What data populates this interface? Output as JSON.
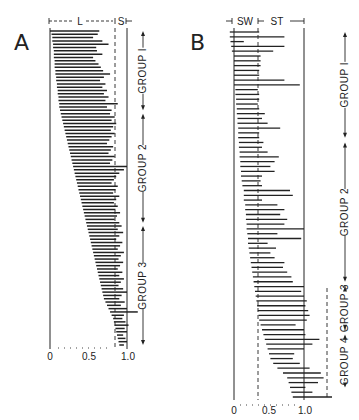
{
  "chart_data": [
    {
      "type": "bar",
      "orientation": "horizontal",
      "panel": "A",
      "title": "A",
      "header_labels": [
        "L",
        "S"
      ],
      "xlabel": "",
      "ylabel": "",
      "xlim": [
        0,
        1.0
      ],
      "x_ticks": [
        "0",
        "0.5",
        "1.0"
      ],
      "boundary_dashed_at": 0.85,
      "groups": [
        {
          "label": "GROUP 1",
          "row_range": [
            0,
            24
          ]
        },
        {
          "label": "GROUP 2",
          "row_range": [
            25,
            58
          ]
        },
        {
          "label": "GROUP 3",
          "row_range": [
            59,
            95
          ]
        }
      ],
      "bars": [
        {
          "start": 0.0,
          "end": 0.64
        },
        {
          "start": 0.02,
          "end": 0.62
        },
        {
          "start": 0.03,
          "end": 0.56
        },
        {
          "start": 0.03,
          "end": 0.68
        },
        {
          "start": 0.04,
          "end": 0.76
        },
        {
          "start": 0.04,
          "end": 0.6
        },
        {
          "start": 0.05,
          "end": 0.61
        },
        {
          "start": 0.05,
          "end": 0.68
        },
        {
          "start": 0.05,
          "end": 0.56
        },
        {
          "start": 0.06,
          "end": 0.59
        },
        {
          "start": 0.06,
          "end": 0.63
        },
        {
          "start": 0.06,
          "end": 0.66
        },
        {
          "start": 0.07,
          "end": 0.69
        },
        {
          "start": 0.07,
          "end": 0.78
        },
        {
          "start": 0.08,
          "end": 0.7
        },
        {
          "start": 0.08,
          "end": 0.65
        },
        {
          "start": 0.09,
          "end": 0.72
        },
        {
          "start": 0.09,
          "end": 0.68
        },
        {
          "start": 0.1,
          "end": 0.74
        },
        {
          "start": 0.1,
          "end": 0.7
        },
        {
          "start": 0.11,
          "end": 0.76
        },
        {
          "start": 0.11,
          "end": 0.72
        },
        {
          "start": 0.12,
          "end": 0.88
        },
        {
          "start": 0.12,
          "end": 0.74
        },
        {
          "start": 0.13,
          "end": 0.8
        },
        {
          "start": 0.14,
          "end": 0.78
        },
        {
          "start": 0.15,
          "end": 0.84
        },
        {
          "start": 0.16,
          "end": 0.8
        },
        {
          "start": 0.17,
          "end": 0.86
        },
        {
          "start": 0.18,
          "end": 0.82
        },
        {
          "start": 0.19,
          "end": 0.79
        },
        {
          "start": 0.2,
          "end": 0.84
        },
        {
          "start": 0.21,
          "end": 0.8
        },
        {
          "start": 0.22,
          "end": 0.77
        },
        {
          "start": 0.23,
          "end": 0.74
        },
        {
          "start": 0.24,
          "end": 0.82
        },
        {
          "start": 0.25,
          "end": 0.79
        },
        {
          "start": 0.26,
          "end": 0.76
        },
        {
          "start": 0.27,
          "end": 0.84
        },
        {
          "start": 0.28,
          "end": 0.81
        },
        {
          "start": 0.29,
          "end": 0.78
        },
        {
          "start": 0.3,
          "end": 1.0
        },
        {
          "start": 0.31,
          "end": 0.96
        },
        {
          "start": 0.32,
          "end": 0.9
        },
        {
          "start": 0.33,
          "end": 0.86
        },
        {
          "start": 0.34,
          "end": 0.83
        },
        {
          "start": 0.35,
          "end": 0.8
        },
        {
          "start": 0.36,
          "end": 0.88
        },
        {
          "start": 0.37,
          "end": 0.85
        },
        {
          "start": 0.38,
          "end": 0.82
        },
        {
          "start": 0.39,
          "end": 0.9
        },
        {
          "start": 0.4,
          "end": 0.86
        },
        {
          "start": 0.41,
          "end": 0.83
        },
        {
          "start": 0.42,
          "end": 0.88
        },
        {
          "start": 0.43,
          "end": 0.85
        },
        {
          "start": 0.44,
          "end": 0.91
        },
        {
          "start": 0.45,
          "end": 0.87
        },
        {
          "start": 0.46,
          "end": 0.84
        },
        {
          "start": 0.47,
          "end": 0.9
        },
        {
          "start": 0.48,
          "end": 0.93
        },
        {
          "start": 0.49,
          "end": 0.88
        },
        {
          "start": 0.5,
          "end": 0.95
        },
        {
          "start": 0.51,
          "end": 0.9
        },
        {
          "start": 0.52,
          "end": 0.86
        },
        {
          "start": 0.53,
          "end": 0.94
        },
        {
          "start": 0.54,
          "end": 0.91
        },
        {
          "start": 0.55,
          "end": 0.88
        },
        {
          "start": 0.56,
          "end": 0.96
        },
        {
          "start": 0.57,
          "end": 0.92
        },
        {
          "start": 0.58,
          "end": 0.89
        },
        {
          "start": 0.59,
          "end": 0.95
        },
        {
          "start": 0.6,
          "end": 0.91
        },
        {
          "start": 0.61,
          "end": 0.88
        },
        {
          "start": 0.62,
          "end": 0.94
        },
        {
          "start": 0.63,
          "end": 0.9
        },
        {
          "start": 0.64,
          "end": 0.96
        },
        {
          "start": 0.65,
          "end": 0.92
        },
        {
          "start": 0.66,
          "end": 0.89
        },
        {
          "start": 0.67,
          "end": 0.95
        },
        {
          "start": 0.68,
          "end": 1.0
        },
        {
          "start": 0.69,
          "end": 0.93
        },
        {
          "start": 0.7,
          "end": 0.9
        },
        {
          "start": 0.72,
          "end": 0.97
        },
        {
          "start": 0.74,
          "end": 0.92
        },
        {
          "start": 0.76,
          "end": 1.0
        },
        {
          "start": 0.78,
          "end": 1.14
        },
        {
          "start": 0.8,
          "end": 0.96
        },
        {
          "start": 0.82,
          "end": 0.94
        },
        {
          "start": 0.83,
          "end": 0.98
        },
        {
          "start": 0.84,
          "end": 1.02
        },
        {
          "start": 0.85,
          "end": 0.97
        },
        {
          "start": 0.86,
          "end": 1.0
        },
        {
          "start": 0.87,
          "end": 0.95
        },
        {
          "start": 0.88,
          "end": 0.98
        },
        {
          "start": 0.89,
          "end": 1.0
        },
        {
          "start": 0.9,
          "end": 0.96
        }
      ]
    },
    {
      "type": "bar",
      "orientation": "horizontal",
      "panel": "B",
      "title": "B",
      "header_labels": [
        "SW",
        "ST"
      ],
      "xlabel": "",
      "ylabel": "",
      "xlim": [
        0,
        1.0
      ],
      "x_ticks": [
        "0",
        "0.5",
        "1.0"
      ],
      "boundary_dashed_at": 0.33,
      "groups": [
        {
          "label": "GROUP 1",
          "row_range": [
            0,
            22
          ]
        },
        {
          "label": "GROUP 2",
          "row_range": [
            23,
            52
          ]
        },
        {
          "label": "GROUP 3",
          "row_range": [
            53,
            62
          ]
        },
        {
          "label": "GROUP 4",
          "row_range": [
            63,
            74
          ]
        }
      ],
      "bars": [
        {
          "start": -0.06,
          "end": 0.36
        },
        {
          "start": -0.06,
          "end": 0.72
        },
        {
          "start": -0.05,
          "end": 0.14
        },
        {
          "start": -0.04,
          "end": 0.72
        },
        {
          "start": -0.03,
          "end": 0.56
        },
        {
          "start": 0.0,
          "end": 0.38
        },
        {
          "start": 0.0,
          "end": 0.38
        },
        {
          "start": 0.0,
          "end": 0.38
        },
        {
          "start": 0.0,
          "end": 0.36
        },
        {
          "start": 0.0,
          "end": 0.36
        },
        {
          "start": 0.0,
          "end": 0.72
        },
        {
          "start": 0.0,
          "end": 0.94
        },
        {
          "start": 0.02,
          "end": 0.34
        },
        {
          "start": 0.02,
          "end": 0.36
        },
        {
          "start": 0.03,
          "end": 0.36
        },
        {
          "start": 0.03,
          "end": 0.34
        },
        {
          "start": 0.04,
          "end": 0.36
        },
        {
          "start": 0.04,
          "end": 0.44
        },
        {
          "start": 0.05,
          "end": 0.4
        },
        {
          "start": 0.05,
          "end": 0.48
        },
        {
          "start": 0.06,
          "end": 0.66
        },
        {
          "start": 0.06,
          "end": 0.36
        },
        {
          "start": 0.06,
          "end": 0.36
        },
        {
          "start": 0.07,
          "end": 0.42
        },
        {
          "start": 0.07,
          "end": 0.4
        },
        {
          "start": 0.08,
          "end": 0.48
        },
        {
          "start": 0.08,
          "end": 0.64
        },
        {
          "start": 0.09,
          "end": 0.58
        },
        {
          "start": 0.09,
          "end": 0.52
        },
        {
          "start": 0.1,
          "end": 0.58
        },
        {
          "start": 0.1,
          "end": 0.4
        },
        {
          "start": 0.11,
          "end": 0.38
        },
        {
          "start": 0.12,
          "end": 0.4
        },
        {
          "start": 0.14,
          "end": 0.8
        },
        {
          "start": 0.14,
          "end": 0.84
        },
        {
          "start": 0.14,
          "end": 0.4
        },
        {
          "start": 0.16,
          "end": 0.62
        },
        {
          "start": 0.16,
          "end": 0.72
        },
        {
          "start": 0.17,
          "end": 0.66
        },
        {
          "start": 0.17,
          "end": 0.76
        },
        {
          "start": 0.18,
          "end": 0.72
        },
        {
          "start": 0.18,
          "end": 1.0
        },
        {
          "start": 0.19,
          "end": 0.62
        },
        {
          "start": 0.2,
          "end": 0.96
        },
        {
          "start": 0.2,
          "end": 0.48
        },
        {
          "start": 0.21,
          "end": 0.6
        },
        {
          "start": 0.22,
          "end": 0.52
        },
        {
          "start": 0.23,
          "end": 0.58
        },
        {
          "start": 0.24,
          "end": 0.72
        },
        {
          "start": 0.25,
          "end": 0.7
        },
        {
          "start": 0.26,
          "end": 0.76
        },
        {
          "start": 0.27,
          "end": 0.82
        },
        {
          "start": 0.28,
          "end": 0.84
        },
        {
          "start": 0.29,
          "end": 1.0
        },
        {
          "start": 0.3,
          "end": 0.96
        },
        {
          "start": 0.31,
          "end": 1.0
        },
        {
          "start": 0.32,
          "end": 1.04
        },
        {
          "start": 0.33,
          "end": 1.02
        },
        {
          "start": 0.34,
          "end": 1.06
        },
        {
          "start": 0.35,
          "end": 1.08
        },
        {
          "start": 0.36,
          "end": 1.04
        },
        {
          "start": 0.38,
          "end": 0.88
        },
        {
          "start": 0.4,
          "end": 1.0
        },
        {
          "start": 0.42,
          "end": 1.02
        },
        {
          "start": 0.44,
          "end": 1.22
        },
        {
          "start": 0.46,
          "end": 1.12
        },
        {
          "start": 0.48,
          "end": 1.0
        },
        {
          "start": 0.5,
          "end": 0.86
        },
        {
          "start": 0.52,
          "end": 0.84
        },
        {
          "start": 0.56,
          "end": 0.94
        },
        {
          "start": 0.62,
          "end": 1.08
        },
        {
          "start": 0.7,
          "end": 1.24
        },
        {
          "start": 0.76,
          "end": 1.28
        },
        {
          "start": 0.78,
          "end": 1.2
        },
        {
          "start": 0.8,
          "end": 1.02
        },
        {
          "start": 0.82,
          "end": 1.12
        },
        {
          "start": 0.84,
          "end": 1.4
        }
      ],
      "extra_dashed_line": {
        "x": 1.3,
        "from_row": 53
      }
    }
  ],
  "panels": {
    "a": {
      "letter": "A",
      "hdr_left": "L",
      "hdr_right": "S",
      "tick_0": "0",
      "tick_mid": "0.5",
      "tick_max": "1.0",
      "groups": [
        "GROUP 1",
        "GROUP 2",
        "GROUP 3"
      ]
    },
    "b": {
      "letter": "B",
      "hdr_left": "SW",
      "hdr_right": "ST",
      "tick_0": "0",
      "tick_mid": "0.5",
      "tick_max": "1.0",
      "groups": [
        "GROUP 1",
        "GROUP 2",
        "GROUP 3",
        "GROUP 4"
      ]
    }
  },
  "colors": {
    "ink": "#222222",
    "background": "#ffffff"
  }
}
